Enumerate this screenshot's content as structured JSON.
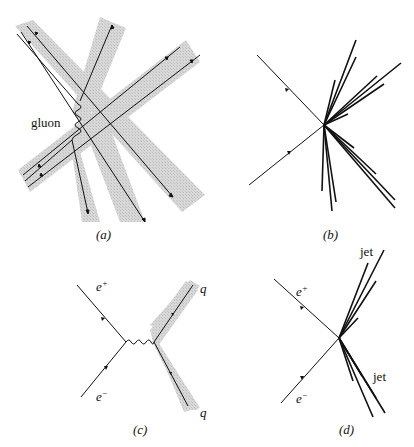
{
  "figure": {
    "panels": [
      {
        "id": "a",
        "caption": "(a)",
        "labels": {
          "gluon": "gluon"
        },
        "description": "Quark lines with shaded hadronization bands; one gluon exchange"
      },
      {
        "id": "b",
        "caption": "(b)",
        "description": "e+e- annihilation producing many hadron tracks"
      },
      {
        "id": "c",
        "caption": "(c)",
        "labels": {
          "e_plus": "e",
          "e_plus_sup": "+",
          "e_minus": "e",
          "e_minus_sup": "−",
          "q_top": "q",
          "q_bottom": "q"
        },
        "description": "e+e- annihilation via virtual photon into quark-antiquark pair with shaded bands"
      },
      {
        "id": "d",
        "caption": "(d)",
        "labels": {
          "e_plus": "e",
          "e_plus_sup": "+",
          "e_minus": "e",
          "e_minus_sup": "−",
          "jet_top": "jet",
          "jet_bottom": "jet"
        },
        "description": "Two-jet event"
      }
    ],
    "colors": {
      "line": "#111111",
      "band": "#cfcfcf",
      "background": "#ffffff"
    }
  }
}
